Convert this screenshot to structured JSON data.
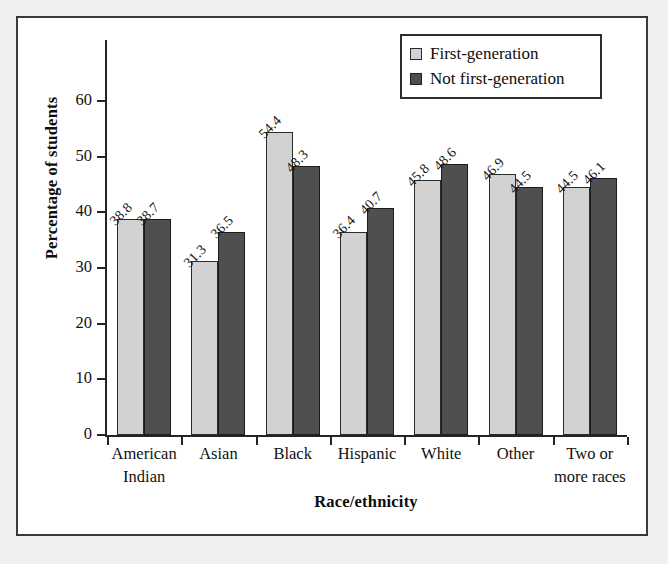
{
  "page": {
    "cutoff_text_above_figure": "—"
  },
  "figure": {
    "y_axis_title": "Percentage of students",
    "x_axis_title": "Race/ethnicity",
    "y_ticks": [
      "0",
      "10",
      "20",
      "30",
      "40",
      "50",
      "60"
    ],
    "legend": {
      "items": [
        {
          "label": "First-generation",
          "swatch": "light-gray-square",
          "color": "#d2d2d2"
        },
        {
          "label": "Not first-generation",
          "swatch": "dark-gray-square",
          "color": "#4f4f4f"
        }
      ]
    }
  },
  "chart_data": {
    "type": "bar",
    "title": "",
    "xlabel": "Race/ethnicity",
    "ylabel": "Percentage of students",
    "ylim": [
      0,
      65
    ],
    "y_ticks": [
      0,
      10,
      20,
      30,
      40,
      50,
      60
    ],
    "grid": false,
    "legend_position": "top-right",
    "categories": [
      "American Indian",
      "Asian",
      "Black",
      "Hispanic",
      "White",
      "Other",
      "Two or more races"
    ],
    "category_lines": [
      [
        "American",
        "Indian"
      ],
      [
        "Asian",
        ""
      ],
      [
        "Black",
        ""
      ],
      [
        "Hispanic",
        ""
      ],
      [
        "White",
        ""
      ],
      [
        "Other",
        ""
      ],
      [
        "Two or",
        "more races"
      ]
    ],
    "series": [
      {
        "name": "First-generation",
        "color": "#d2d2d2",
        "values": [
          38.8,
          31.3,
          54.4,
          36.4,
          45.8,
          46.9,
          44.5
        ],
        "labels": [
          "38.8",
          "31.3",
          "54.4",
          "36.4",
          "45.8",
          "46.9",
          "44.5"
        ]
      },
      {
        "name": "Not first-generation",
        "color": "#4f4f4f",
        "values": [
          38.7,
          36.5,
          48.3,
          40.7,
          48.6,
          44.5,
          46.1
        ],
        "labels": [
          "38.7",
          "36.5",
          "48.3",
          "40.7",
          "48.6",
          "44.5",
          "46.1"
        ]
      }
    ]
  }
}
